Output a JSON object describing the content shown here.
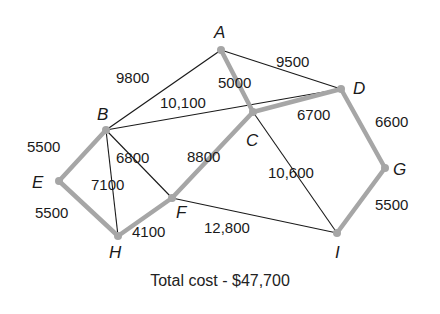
{
  "diagram": {
    "type": "weighted-graph-minimum-spanning-tree",
    "nodes": [
      {
        "id": "A",
        "x": 221,
        "y": 50,
        "lx": 214,
        "ly": 38
      },
      {
        "id": "B",
        "x": 106,
        "y": 130,
        "lx": 97,
        "ly": 120
      },
      {
        "id": "C",
        "x": 253,
        "y": 112,
        "lx": 246,
        "ly": 146
      },
      {
        "id": "D",
        "x": 341,
        "y": 89,
        "lx": 353,
        "ly": 94
      },
      {
        "id": "E",
        "x": 59,
        "y": 181,
        "lx": 32,
        "ly": 188
      },
      {
        "id": "F",
        "x": 172,
        "y": 198,
        "lx": 176,
        "ly": 218
      },
      {
        "id": "G",
        "x": 385,
        "y": 168,
        "lx": 393,
        "ly": 175
      },
      {
        "id": "H",
        "x": 118,
        "y": 236,
        "lx": 109,
        "ly": 258
      },
      {
        "id": "I",
        "x": 337,
        "y": 233,
        "lx": 335,
        "ly": 258
      }
    ],
    "edges": [
      {
        "from": "A",
        "to": "B",
        "weight": "9800",
        "in_tree": false,
        "lx": 116,
        "ly": 83
      },
      {
        "from": "A",
        "to": "D",
        "weight": "9500",
        "in_tree": false,
        "lx": 276,
        "ly": 67
      },
      {
        "from": "B",
        "to": "D",
        "weight": "10,100",
        "in_tree": false,
        "lx": 160,
        "ly": 108
      },
      {
        "from": "B",
        "to": "H",
        "weight": "7100",
        "in_tree": false,
        "lx": 91,
        "ly": 190
      },
      {
        "from": "B",
        "to": "F",
        "weight": "6800",
        "in_tree": false,
        "lx": 116,
        "ly": 163
      },
      {
        "from": "F",
        "to": "I",
        "weight": "12,800",
        "in_tree": false,
        "lx": 204,
        "ly": 233
      },
      {
        "from": "C",
        "to": "I",
        "weight": "10,600",
        "in_tree": false,
        "lx": 268,
        "ly": 178
      },
      {
        "from": "A",
        "to": "C",
        "weight": "5000",
        "in_tree": true,
        "lx": 218,
        "ly": 88
      },
      {
        "from": "C",
        "to": "D",
        "weight": "6700",
        "in_tree": true,
        "lx": 297,
        "ly": 120
      },
      {
        "from": "D",
        "to": "G",
        "weight": "6600",
        "in_tree": true,
        "lx": 375,
        "ly": 127
      },
      {
        "from": "G",
        "to": "I",
        "weight": "5500",
        "in_tree": true,
        "lx": 375,
        "ly": 210
      },
      {
        "from": "B",
        "to": "E",
        "weight": "5500",
        "in_tree": true,
        "lx": 27,
        "ly": 152
      },
      {
        "from": "E",
        "to": "H",
        "weight": "5500",
        "in_tree": true,
        "lx": 35,
        "ly": 218
      },
      {
        "from": "H",
        "to": "F",
        "weight": "4100",
        "in_tree": true,
        "lx": 132,
        "ly": 237
      },
      {
        "from": "F",
        "to": "C",
        "weight": "8800",
        "in_tree": true,
        "lx": 187,
        "ly": 162
      }
    ],
    "colors": {
      "tree_edge": "#a6a6a6",
      "other_edge": "#1a1a1a",
      "node": "#a6a6a6"
    }
  },
  "caption": "Total cost - $47,700"
}
